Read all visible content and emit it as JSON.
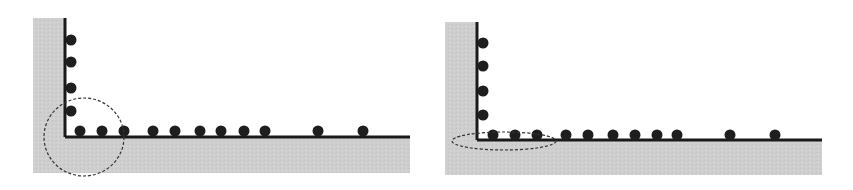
{
  "colors": {
    "background": "#ffffff",
    "substrate": "#cfcfcf",
    "axis": "#1a1a1a",
    "particle": "#1e1e1e",
    "highlight": "#333333"
  },
  "panels": [
    {
      "id": "left",
      "gray": {
        "x": 33,
        "y": 18,
        "w": 377,
        "h": 155
      },
      "white": {
        "x": 65,
        "y": 18,
        "w": 345,
        "h": 119
      },
      "corner": {
        "x": 65,
        "y": 137
      },
      "vertical_particles_y": [
        40,
        62,
        88,
        111
      ],
      "vertical_particles_x": 71,
      "horizontal_particles_x": [
        80,
        102,
        124,
        153,
        175,
        200,
        221,
        244,
        265,
        318,
        363
      ],
      "horizontal_particles_y": 131,
      "highlight": {
        "type": "circle",
        "cx": 84,
        "cy": 137,
        "rx": 40,
        "ry": 39
      }
    },
    {
      "id": "right",
      "gray": {
        "x": 445,
        "y": 22,
        "w": 377,
        "h": 153
      },
      "white": {
        "x": 477,
        "y": 22,
        "w": 345,
        "h": 118
      },
      "corner": {
        "x": 477,
        "y": 140
      },
      "vertical_particles_y": [
        43,
        66,
        91,
        115
      ],
      "vertical_particles_x": 483,
      "horizontal_particles_x": [
        493,
        515,
        537,
        566,
        588,
        613,
        635,
        657,
        677,
        730,
        775
      ],
      "horizontal_particles_y": 135,
      "highlight": {
        "type": "ellipse",
        "cx": 504,
        "cy": 141,
        "rx": 52,
        "ry": 9
      }
    }
  ]
}
